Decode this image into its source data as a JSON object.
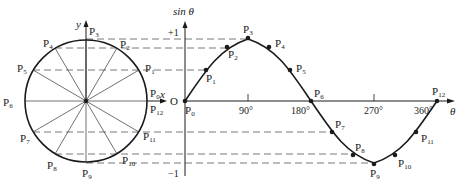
{
  "diagram": {
    "colors": {
      "stroke": "#1a1a1a",
      "dash": "#555555",
      "background": "#ffffff"
    },
    "circle": {
      "x_axis_label": "x",
      "y_axis_label": "y",
      "center_label": "O",
      "points": [
        {
          "name": "P",
          "sub": "0",
          "angle_deg": 0
        },
        {
          "name": "P",
          "sub": "1",
          "angle_deg": 30
        },
        {
          "name": "P",
          "sub": "2",
          "angle_deg": 60
        },
        {
          "name": "P",
          "sub": "3",
          "angle_deg": 90
        },
        {
          "name": "P",
          "sub": "4",
          "angle_deg": 120
        },
        {
          "name": "P",
          "sub": "5",
          "angle_deg": 150
        },
        {
          "name": "P",
          "sub": "6",
          "angle_deg": 180
        },
        {
          "name": "P",
          "sub": "7",
          "angle_deg": 210
        },
        {
          "name": "P",
          "sub": "8",
          "angle_deg": 240
        },
        {
          "name": "P",
          "sub": "9",
          "angle_deg": 270
        },
        {
          "name": "P",
          "sub": "10",
          "angle_deg": 300
        },
        {
          "name": "P",
          "sub": "11",
          "angle_deg": 330
        },
        {
          "name": "P",
          "sub": "12",
          "angle_deg": 360
        }
      ]
    },
    "graph": {
      "y_axis_label": "sin θ",
      "x_axis_label": "θ",
      "origin_label": "O",
      "y_ticks": [
        "+1",
        "−1"
      ],
      "x_ticks": [
        "90°",
        "180°",
        "270°",
        "360°"
      ],
      "curve": "sin θ, 0° to 360°"
    },
    "labels": {
      "p_letter": "P",
      "x": "x",
      "y": "y",
      "O": "O",
      "theta": "θ",
      "sin": "sin θ",
      "plus1": "+1",
      "minus1": "−1",
      "t90": "90°",
      "t180": "180°",
      "t270": "270°",
      "t360": "360°",
      "s0": "0",
      "s1": "1",
      "s2": "2",
      "s3": "3",
      "s4": "4",
      "s5": "5",
      "s6": "6",
      "s7": "7",
      "s8": "8",
      "s9": "9",
      "s10": "10",
      "s11": "11",
      "s12": "12"
    }
  }
}
